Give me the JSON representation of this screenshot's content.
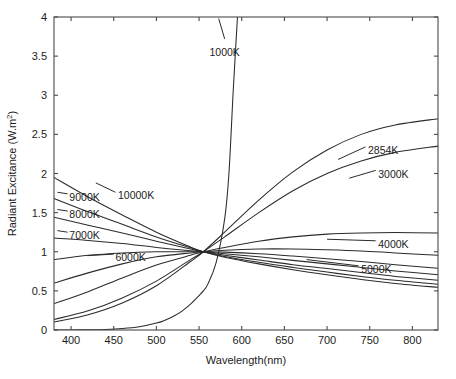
{
  "chart_data": {
    "type": "line",
    "title": "",
    "xlabel": "Wavelength(nm)",
    "ylabel": "Radiant Excitance (W.m",
    "ylabel_sup": "2",
    "ylabel_tail": ")",
    "xlim": [
      380,
      830
    ],
    "ylim": [
      0,
      4
    ],
    "xticks": [
      400,
      450,
      500,
      550,
      600,
      650,
      700,
      750,
      800
    ],
    "yticks": [
      0,
      0.5,
      1,
      1.5,
      2,
      2.5,
      3,
      3.5,
      4
    ],
    "xtick_labels": [
      "400",
      "450",
      "500",
      "550",
      "600",
      "650",
      "700",
      "750",
      "800"
    ],
    "ytick_labels": [
      "0",
      "0.5",
      "1",
      "1.5",
      "2",
      "2.5",
      "3",
      "3.5",
      "4"
    ],
    "grid": false,
    "legend_position": "inline-annotations",
    "normalization_note": "All curves normalized to 1.0 at 555 nm",
    "series": [
      {
        "name": "1000K",
        "label": "1000K",
        "label_x": 580,
        "label_y": 3.55,
        "label_anchor": "middle",
        "x": [
          380,
          400,
          420,
          440,
          460,
          480,
          500,
          510,
          520,
          530,
          540,
          550,
          555,
          560,
          570,
          580,
          585,
          590,
          595
        ],
        "y": [
          0.0002,
          0.0008,
          0.0026,
          0.0072,
          0.018,
          0.041,
          0.088,
          0.125,
          0.175,
          0.242,
          0.33,
          0.44,
          0.5,
          0.58,
          0.86,
          1.42,
          2.0,
          3.05,
          4.0
        ]
      },
      {
        "name": "2854K",
        "label": "2854K",
        "label_x": 748,
        "label_y": 2.3,
        "label_anchor": "start",
        "x": [
          380,
          420,
          460,
          500,
          540,
          555,
          580,
          620,
          660,
          700,
          740,
          780,
          830
        ],
        "y": [
          0.102,
          0.195,
          0.345,
          0.565,
          0.875,
          1.0,
          1.25,
          1.66,
          2.02,
          2.3,
          2.5,
          2.62,
          2.7
        ]
      },
      {
        "name": "3000K",
        "label": "3000K",
        "label_x": 760,
        "label_y": 2.0,
        "label_anchor": "start",
        "x": [
          380,
          420,
          460,
          500,
          540,
          555,
          580,
          620,
          660,
          700,
          740,
          780,
          830
        ],
        "y": [
          0.135,
          0.245,
          0.41,
          0.625,
          0.9,
          1.0,
          1.19,
          1.5,
          1.78,
          2.0,
          2.16,
          2.27,
          2.35
        ]
      },
      {
        "name": "4000K",
        "label": "4000K",
        "label_x": 760,
        "label_y": 1.1,
        "label_anchor": "start",
        "x": [
          380,
          420,
          460,
          500,
          540,
          555,
          580,
          620,
          660,
          700,
          740,
          780,
          830
        ],
        "y": [
          0.335,
          0.49,
          0.665,
          0.83,
          0.955,
          1.0,
          1.055,
          1.135,
          1.19,
          1.225,
          1.24,
          1.245,
          1.24
        ]
      },
      {
        "name": "5000K",
        "label": "5000K",
        "label_x": 740,
        "label_y": 0.78,
        "label_anchor": "start",
        "x": [
          380,
          420,
          460,
          500,
          540,
          555,
          580,
          620,
          660,
          700,
          740,
          780,
          830
        ],
        "y": [
          0.6,
          0.73,
          0.845,
          0.935,
          0.985,
          1.0,
          1.02,
          1.035,
          1.035,
          1.025,
          1.01,
          0.985,
          0.955
        ]
      },
      {
        "name": "6000K",
        "label": "6000K",
        "label_x": 452,
        "label_y": 0.93,
        "label_anchor": "start",
        "x": [
          380,
          420,
          460,
          500,
          540,
          555,
          580,
          620,
          660,
          700,
          740,
          780,
          830
        ],
        "y": [
          0.9,
          0.955,
          0.985,
          1.0,
          1.0,
          1.0,
          0.995,
          0.975,
          0.945,
          0.91,
          0.875,
          0.835,
          0.79
        ]
      },
      {
        "name": "7000K",
        "label": "7000K",
        "label_x": 398,
        "label_y": 1.21,
        "label_anchor": "start",
        "x": [
          380,
          420,
          460,
          500,
          540,
          555,
          580,
          620,
          660,
          700,
          740,
          780,
          830
        ],
        "y": [
          1.175,
          1.145,
          1.105,
          1.055,
          1.012,
          1.0,
          0.975,
          0.935,
          0.89,
          0.845,
          0.8,
          0.755,
          0.705
        ]
      },
      {
        "name": "8000K",
        "label": "8000K",
        "label_x": 398,
        "label_y": 1.48,
        "label_anchor": "start",
        "x": [
          380,
          420,
          460,
          500,
          540,
          555,
          580,
          620,
          660,
          700,
          740,
          780,
          830
        ],
        "y": [
          1.44,
          1.34,
          1.24,
          1.135,
          1.035,
          1.0,
          0.955,
          0.895,
          0.835,
          0.785,
          0.735,
          0.685,
          0.635
        ]
      },
      {
        "name": "9000K",
        "label": "9000K",
        "label_x": 398,
        "label_y": 1.7,
        "label_anchor": "start",
        "x": [
          380,
          420,
          460,
          500,
          540,
          555,
          580,
          620,
          660,
          700,
          740,
          780,
          830
        ],
        "y": [
          1.68,
          1.51,
          1.35,
          1.19,
          1.05,
          1.0,
          0.94,
          0.865,
          0.8,
          0.74,
          0.685,
          0.635,
          0.585
        ]
      },
      {
        "name": "10000K",
        "label": "10000K",
        "label_x": 455,
        "label_y": 1.72,
        "label_anchor": "start",
        "x": [
          380,
          420,
          460,
          500,
          540,
          555,
          580,
          620,
          660,
          700,
          740,
          780,
          830
        ],
        "y": [
          1.95,
          1.7,
          1.47,
          1.25,
          1.06,
          1.0,
          0.93,
          0.845,
          0.77,
          0.705,
          0.645,
          0.595,
          0.545
        ]
      }
    ],
    "annotations": [
      {
        "text": "1000K",
        "leader_from": [
          580,
          3.72
        ],
        "leader_to": [
          573,
          3.98
        ]
      },
      {
        "text": "2854K",
        "leader_from": [
          745,
          2.34
        ],
        "leader_to": [
          713,
          2.18
        ]
      },
      {
        "text": "3000K",
        "leader_from": [
          757,
          2.04
        ],
        "leader_to": [
          726,
          1.94
        ]
      },
      {
        "text": "4000K",
        "leader_from": [
          757,
          1.14
        ],
        "leader_to": [
          700,
          1.16
        ]
      },
      {
        "text": "5000K",
        "leader_from": [
          737,
          0.82
        ],
        "leader_to": [
          676,
          0.9
        ]
      },
      {
        "text": "6000K",
        "leader_from": [
          450,
          0.97
        ],
        "leader_to": [
          419,
          0.95
        ]
      },
      {
        "text": "7000K",
        "leader_from": [
          396,
          1.25
        ],
        "leader_to": [
          384,
          1.27
        ]
      },
      {
        "text": "8000K",
        "leader_from": [
          396,
          1.52
        ],
        "leader_to": [
          384,
          1.54
        ]
      },
      {
        "text": "9000K",
        "leader_from": [
          396,
          1.74
        ],
        "leader_to": [
          384,
          1.76
        ]
      },
      {
        "text": "10000K",
        "leader_from": [
          452,
          1.76
        ],
        "leader_to": [
          429,
          1.88
        ]
      }
    ]
  }
}
